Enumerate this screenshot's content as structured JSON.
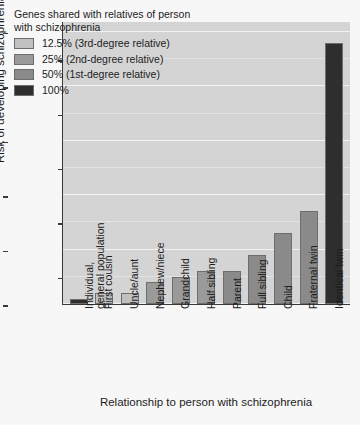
{
  "chart_data": {
    "type": "bar",
    "title": "",
    "xlabel": "Relationship to person with schizophrenia",
    "ylabel": "Risk of developing schizophrenia (%)",
    "ylim": [
      0,
      52
    ],
    "yticks": [
      0,
      10,
      20,
      30,
      40,
      50
    ],
    "yticks_minor": [
      5,
      15,
      25,
      35,
      45
    ],
    "grid": true,
    "legend_position": "top-left",
    "categories": [
      "Individual,\ngeneral population",
      "First cousin",
      "Uncle/aunt",
      "Nephew/niece",
      "Grandchild",
      "Half sibling",
      "Parent",
      "Full sibling",
      "Child",
      "Fraternal twin",
      "Identical twin"
    ],
    "values": [
      1,
      2,
      2,
      4,
      5,
      6,
      6,
      9,
      13,
      17,
      48
    ],
    "bar_groups": [
      "general",
      "12.5%",
      "12.5%",
      "25%",
      "25%",
      "25%",
      "50%",
      "50%",
      "50%",
      "50%",
      "100%"
    ]
  },
  "legend": {
    "title": "Genes shared with relatives of person with schizophrenia",
    "items": [
      {
        "label": "12.5% (3rd-degree relative)",
        "color": "#c0c0c0"
      },
      {
        "label": "25% (2nd-degree relative)",
        "color": "#9a9a9a"
      },
      {
        "label": "50% (1st-degree relative)",
        "color": "#8a8a8a"
      },
      {
        "label": "100%",
        "color": "#2e2e2e"
      }
    ]
  },
  "colors": {
    "plot_background": "#d4d4d4",
    "page_background": "#f7f7f7",
    "axis": "#3a3a3a",
    "gridline": "#f2f2f2",
    "bar_general": "#2e2e2e",
    "bar_12_5": "#c0c0c0",
    "bar_25": "#9a9a9a",
    "bar_50": "#8a8a8a",
    "bar_100": "#2e2e2e",
    "bar_border": "#6d6d6d"
  },
  "ytick_labels": [
    "0",
    "10",
    "20",
    "30",
    "40",
    "50"
  ]
}
